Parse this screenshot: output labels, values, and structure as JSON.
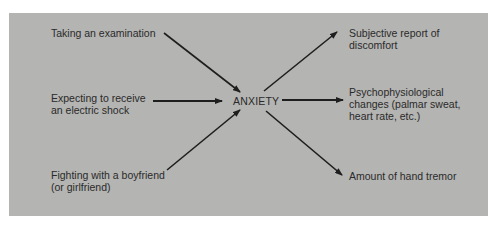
{
  "diagram": {
    "center": {
      "label": "ANXIETY"
    },
    "causes": [
      {
        "lines": [
          "Taking an examination"
        ]
      },
      {
        "lines": [
          "Expecting to receive",
          "an electric shock"
        ]
      },
      {
        "lines": [
          "Fighting with a boyfriend",
          "(or girlfriend)"
        ]
      }
    ],
    "effects": [
      {
        "lines": [
          "Subjective report of",
          "discomfort"
        ]
      },
      {
        "lines": [
          "Psychophysiological",
          "changes (palmar sweat,",
          "heart rate, etc.)"
        ]
      },
      {
        "lines": [
          "Amount of hand tremor"
        ]
      }
    ],
    "colors": {
      "background": "#b4b4b2",
      "text": "#2a2a2a",
      "arrow": "#1e1e1e"
    }
  }
}
